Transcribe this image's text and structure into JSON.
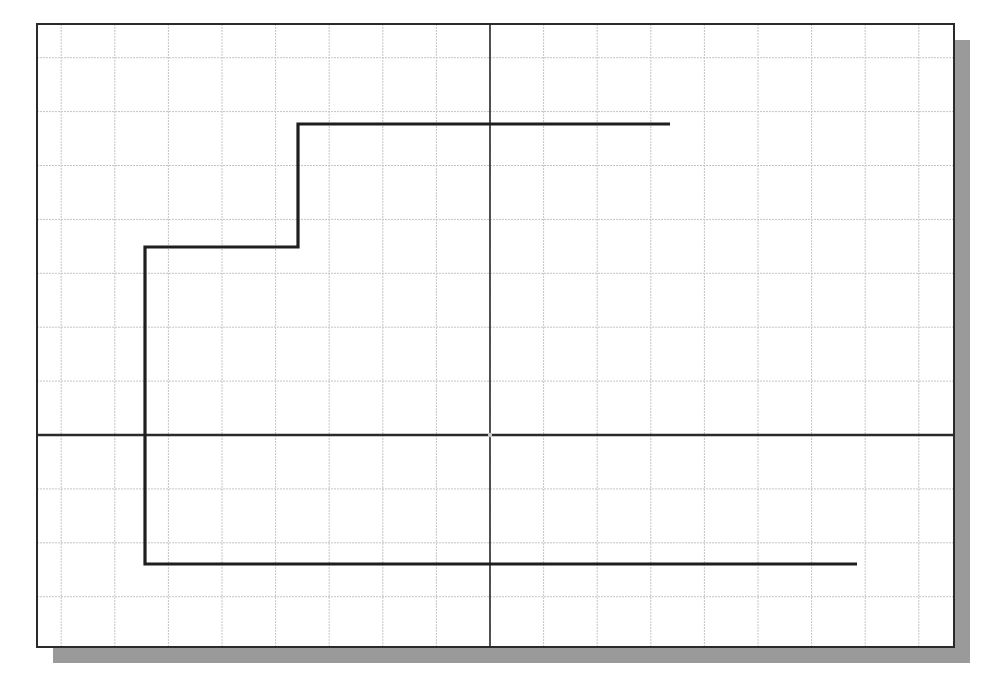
{
  "canvas": {
    "width": 990,
    "height": 679,
    "background": "#ffffff"
  },
  "frame": {
    "x": 37,
    "y": 24,
    "width": 917,
    "height": 623,
    "border_color": "#2a2a2a",
    "border_width": 2,
    "fill": "#ffffff"
  },
  "shadow": {
    "offset_x": 16,
    "offset_y": 16,
    "color": "#9a9a9a"
  },
  "grid": {
    "origin_x": 490,
    "origin_y": 435,
    "spacing_x": 53.6,
    "spacing_y": 53.9,
    "color": "#c4c4c4",
    "line_width": 1,
    "dashed": true
  },
  "axes": {
    "origin": {
      "x": 490,
      "y": 435
    },
    "color": "#2a2a2a",
    "x_axis_width": 2.5,
    "y_axis_width": 1.6,
    "origin_marker_color": "#c8c8c8"
  },
  "polyline": {
    "color": "#1e1e1e",
    "width": 3.2,
    "points": [
      [
        670,
        124
      ],
      [
        298,
        124
      ],
      [
        298,
        247
      ],
      [
        145,
        247
      ],
      [
        145,
        564
      ],
      [
        857,
        564
      ]
    ]
  }
}
